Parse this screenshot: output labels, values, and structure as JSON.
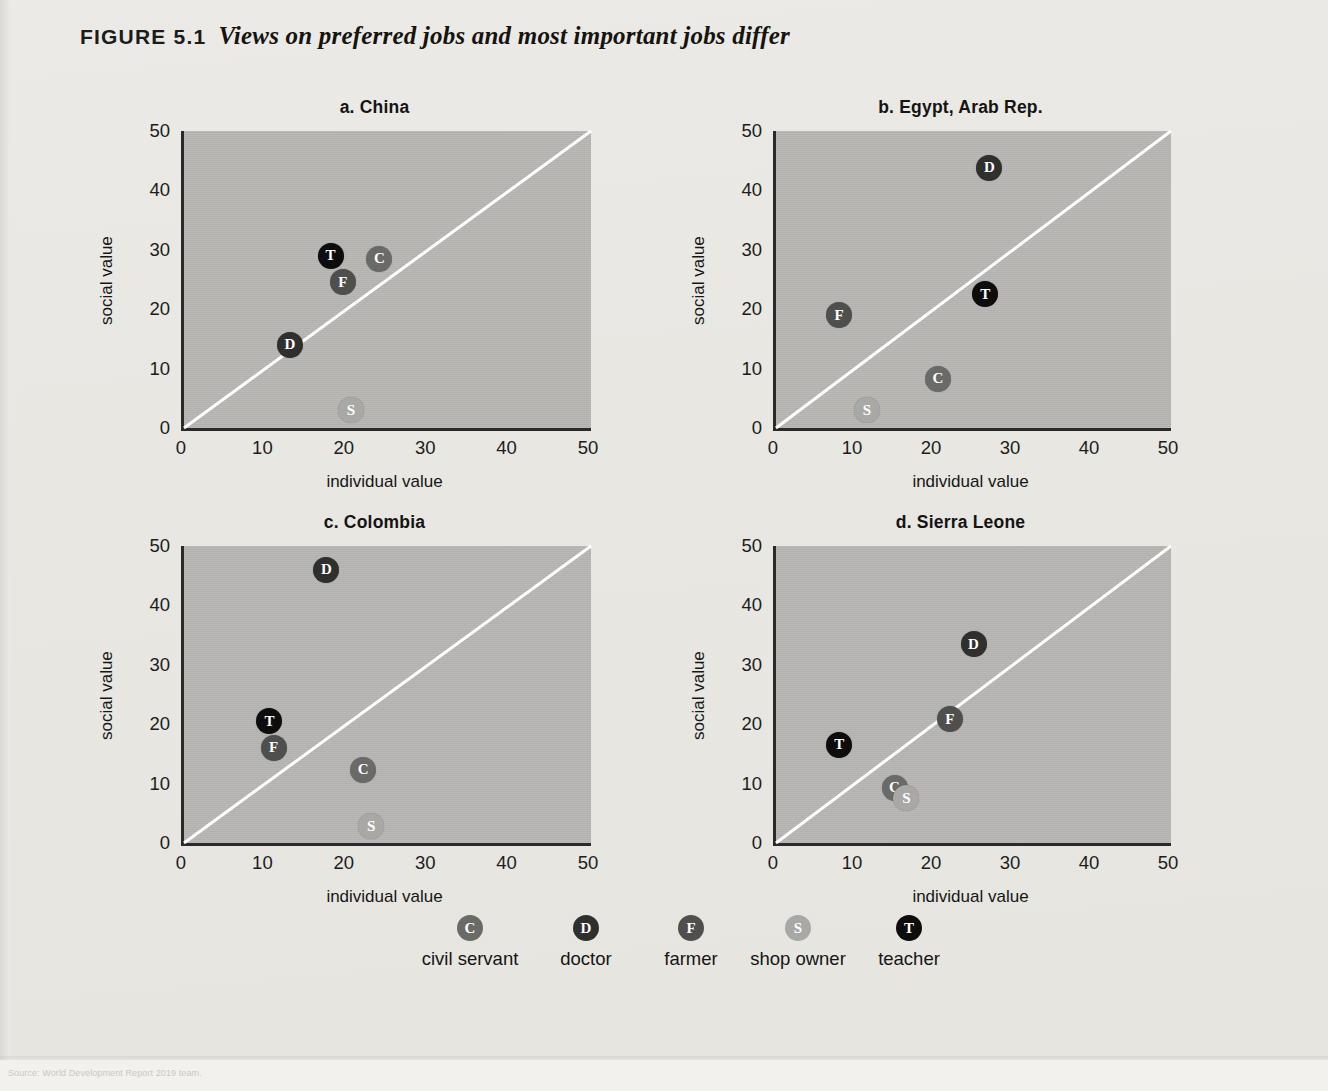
{
  "figure": {
    "label": "FIGURE 5.1",
    "title": "Views on preferred jobs and most important jobs differ"
  },
  "axes": {
    "xlabel": "individual value",
    "ylabel": "social value",
    "xticks": [
      "0",
      "10",
      "20",
      "30",
      "40",
      "50"
    ],
    "yticks": [
      "0",
      "10",
      "20",
      "30",
      "40",
      "50"
    ]
  },
  "legend": {
    "items": [
      {
        "key": "C",
        "label": "civil servant",
        "color": "#6a6a68"
      },
      {
        "key": "D",
        "label": "doctor",
        "color": "#2f2f2e"
      },
      {
        "key": "F",
        "label": "farmer",
        "color": "#4f4f4e"
      },
      {
        "key": "S",
        "label": "shop owner",
        "color": "#a9a8a5"
      },
      {
        "key": "T",
        "label": "teacher",
        "color": "#0d0d0d"
      }
    ]
  },
  "colors": {
    "plot_background": "#b6b5b2",
    "page_background": "#eceae6",
    "axis": "#2a2a2a",
    "diagonal": "#ffffff"
  },
  "chart_data": [
    {
      "type": "scatter",
      "title": "a.  China",
      "xlabel": "individual value",
      "ylabel": "social value",
      "xlim": [
        0,
        50
      ],
      "ylim": [
        0,
        50
      ],
      "xticks": [
        0,
        10,
        20,
        30,
        40,
        50
      ],
      "yticks": [
        0,
        10,
        20,
        30,
        40,
        50
      ],
      "grid": false,
      "annotations": [
        "45-degree reference line from (0,0) to (50,50)"
      ],
      "points": [
        {
          "key": "T",
          "label": "teacher",
          "x": 18.0,
          "y": 29.0
        },
        {
          "key": "C",
          "label": "civil servant",
          "x": 24.0,
          "y": 28.5
        },
        {
          "key": "F",
          "label": "farmer",
          "x": 19.5,
          "y": 24.5
        },
        {
          "key": "D",
          "label": "doctor",
          "x": 13.0,
          "y": 14.0
        },
        {
          "key": "S",
          "label": "shop owner",
          "x": 20.5,
          "y": 3.0
        }
      ]
    },
    {
      "type": "scatter",
      "title": "b.  Egypt, Arab Rep.",
      "xlabel": "individual value",
      "ylabel": "social value",
      "xlim": [
        0,
        50
      ],
      "ylim": [
        0,
        50
      ],
      "xticks": [
        0,
        10,
        20,
        30,
        40,
        50
      ],
      "yticks": [
        0,
        10,
        20,
        30,
        40,
        50
      ],
      "grid": false,
      "annotations": [
        "45-degree reference line from (0,0) to (50,50)"
      ],
      "points": [
        {
          "key": "D",
          "label": "doctor",
          "x": 27.0,
          "y": 43.8
        },
        {
          "key": "T",
          "label": "teacher",
          "x": 26.5,
          "y": 22.5
        },
        {
          "key": "F",
          "label": "farmer",
          "x": 8.0,
          "y": 19.0
        },
        {
          "key": "C",
          "label": "civil servant",
          "x": 20.5,
          "y": 8.3
        },
        {
          "key": "S",
          "label": "shop owner",
          "x": 11.5,
          "y": 3.0
        }
      ]
    },
    {
      "type": "scatter",
      "title": "c.  Colombia",
      "xlabel": "individual value",
      "ylabel": "social value",
      "xlim": [
        0,
        50
      ],
      "ylim": [
        0,
        50
      ],
      "xticks": [
        0,
        10,
        20,
        30,
        40,
        50
      ],
      "yticks": [
        0,
        10,
        20,
        30,
        40,
        50
      ],
      "grid": false,
      "annotations": [
        "45-degree reference line from (0,0) to (50,50)"
      ],
      "points": [
        {
          "key": "D",
          "label": "doctor",
          "x": 17.5,
          "y": 46.0
        },
        {
          "key": "T",
          "label": "teacher",
          "x": 10.5,
          "y": 20.5
        },
        {
          "key": "F",
          "label": "farmer",
          "x": 11.0,
          "y": 16.0
        },
        {
          "key": "C",
          "label": "civil servant",
          "x": 22.0,
          "y": 12.3
        },
        {
          "key": "S",
          "label": "shop owner",
          "x": 23.0,
          "y": 2.8
        }
      ]
    },
    {
      "type": "scatter",
      "title": "d.  Sierra Leone",
      "xlabel": "individual value",
      "ylabel": "social value",
      "xlim": [
        0,
        50
      ],
      "ylim": [
        0,
        50
      ],
      "xticks": [
        0,
        10,
        20,
        30,
        40,
        50
      ],
      "yticks": [
        0,
        10,
        20,
        30,
        40,
        50
      ],
      "grid": false,
      "annotations": [
        "45-degree reference line from (0,0) to (50,50)"
      ],
      "points": [
        {
          "key": "D",
          "label": "doctor",
          "x": 25.0,
          "y": 33.5
        },
        {
          "key": "F",
          "label": "farmer",
          "x": 22.0,
          "y": 20.8
        },
        {
          "key": "T",
          "label": "teacher",
          "x": 8.0,
          "y": 16.5
        },
        {
          "key": "C",
          "label": "civil servant",
          "x": 15.0,
          "y": 9.3
        },
        {
          "key": "S",
          "label": "shop owner",
          "x": 16.5,
          "y": 7.5
        }
      ]
    }
  ]
}
